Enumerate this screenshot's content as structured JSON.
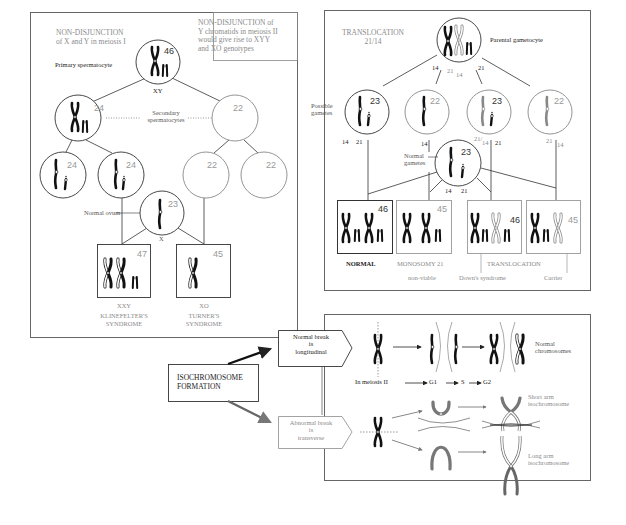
{
  "nondisjunction_panel": {
    "title_line1": "NON-DISJUNCTION",
    "title_line2": "of X and Y in meiosis I",
    "note_line1": "NON-DISJUNCTION  of",
    "note_line2": "Y chromatids in meiosis II",
    "note_line3": "would give rise to XYY",
    "note_line4": "and XO genotypes",
    "primary_label": "Primary spermatocyte",
    "primary_count": "46",
    "primary_genotype": "XY",
    "secondary_label_line1": "Secondary",
    "secondary_label_line2": "spermatocytes",
    "secondary_counts": [
      "24",
      "22"
    ],
    "gamete_counts": [
      "24",
      "24",
      "22",
      "22"
    ],
    "ovum_label": "Normal ovum",
    "ovum_count": "23",
    "ovum_genotype": "X",
    "results": [
      {
        "count": "47",
        "genotype": "XXY",
        "syndrome_line1": "KLINEFELTER'S",
        "syndrome_line2": "SYNDROME"
      },
      {
        "count": "45",
        "genotype": "XO",
        "syndrome_line1": "TURNER'S",
        "syndrome_line2": "SYNDROME"
      }
    ]
  },
  "translocation_panel": {
    "title_line1": "TRANSLOCATION",
    "title_line2": "21/14",
    "parent_label": "Parental gametocyte",
    "parent_split_labels": [
      "14",
      "21",
      "14",
      "21"
    ],
    "gametes_label_line1": "Possible",
    "gametes_label_line2": "gametes",
    "gamete_counts": [
      "23",
      "22",
      "23",
      "22"
    ],
    "gamete_sublabels": [
      {
        "a": "14",
        "b": "21"
      },
      {
        "a": "14",
        "b": ""
      },
      {
        "a": "21/",
        "b": "14",
        "c": "21"
      },
      {
        "a": "21",
        "b": "14"
      }
    ],
    "normal_gametes_line1": "Normal",
    "normal_gametes_line2": "gametes",
    "normal_gametes_count": "23",
    "normal_gametes_sublabels": [
      "14",
      "21"
    ],
    "karyotypes": [
      {
        "count": "46",
        "label": "NORMAL",
        "sublabel": ""
      },
      {
        "count": "45",
        "label": "MONOSOMY 21",
        "sublabel": "non-viable"
      },
      {
        "count": "46",
        "label": "",
        "sublabel": "Down's syndrome"
      },
      {
        "count": "45",
        "label": "",
        "sublabel": "Carrier"
      }
    ],
    "translocation_group_label": "TRANSLOCATION"
  },
  "isochromosome_panel": {
    "main_label_line1": "ISOCHROMOSOME",
    "main_label_line2": "FORMATION",
    "normal_break_line1": "Normal break",
    "normal_break_line2": "is",
    "normal_break_line3": "longitudinal",
    "abnormal_break_line1": "Abnormal break",
    "abnormal_break_line2": "is",
    "abnormal_break_line3": "transverse",
    "meiosis_label": "In meiosis II",
    "phases": [
      "G1",
      "S",
      "G2"
    ],
    "normal_result_line1": "Normal",
    "normal_result_line2": "chromosomes",
    "short_arm_line1": "Short arm",
    "short_arm_line2": "isochromosome",
    "long_arm_line1": "Long arm",
    "long_arm_line2": "isochromosome"
  },
  "colors": {
    "ink": "#1a1a1a",
    "gray_ink": "#8a8a8a",
    "frame": "#555555",
    "paper": "#ffffff"
  }
}
